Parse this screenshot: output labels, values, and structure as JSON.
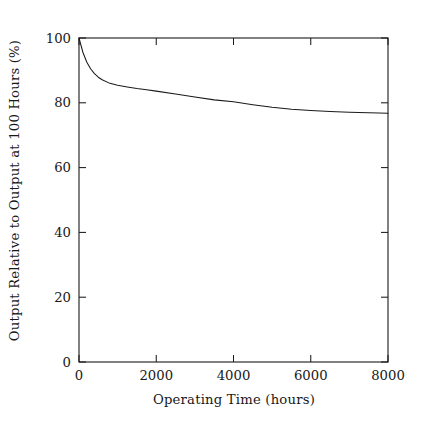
{
  "chart_data": {
    "type": "line",
    "title": "",
    "subtitle": "",
    "xlabel": "Operating Time (hours)",
    "ylabel": "Output Relative to Output at 100 Hours (%)",
    "xlim": [
      0,
      8000
    ],
    "ylim": [
      0,
      100
    ],
    "xticks": [
      0,
      2000,
      4000,
      6000,
      8000
    ],
    "yticks": [
      0,
      20,
      40,
      60,
      80,
      100
    ],
    "xtick_labels": [
      "0",
      "2000",
      "4000",
      "6000",
      "8000"
    ],
    "ytick_labels": [
      "0",
      "20",
      "40",
      "60",
      "80",
      "100"
    ],
    "grid": false,
    "legend": null,
    "annotations": [],
    "line_color": "#1a1a1a",
    "line_width": 1,
    "series": [
      {
        "name": "Relative light output",
        "x": [
          0,
          100,
          200,
          300,
          400,
          500,
          600,
          800,
          1000,
          1250,
          1500,
          1750,
          2000,
          2500,
          3000,
          3500,
          4000,
          4500,
          5000,
          5500,
          6000,
          6500,
          7000,
          7500,
          8000
        ],
        "y": [
          100.0,
          95.6,
          92.6,
          90.5,
          89.0,
          87.9,
          87.1,
          86.0,
          85.4,
          84.9,
          84.4,
          84.0,
          83.6,
          82.7,
          81.8,
          80.9,
          80.3,
          79.4,
          78.6,
          78.0,
          77.6,
          77.3,
          77.1,
          76.9,
          76.8
        ]
      }
    ]
  },
  "figure": {
    "background_color": "#ffffff",
    "axis_color": "#1a1a1a"
  }
}
